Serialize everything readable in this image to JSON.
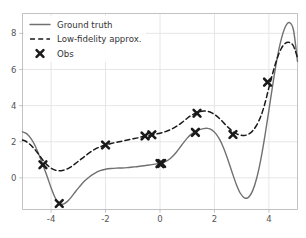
{
  "chart_data": {
    "type": "line",
    "title": "",
    "xlabel": "",
    "ylabel": "",
    "xlim": [
      -5.05,
      5.05
    ],
    "ylim": [
      -1.75,
      9.1
    ],
    "grid": true,
    "xticks": [
      -4,
      -2,
      0,
      2,
      4
    ],
    "xticklabels": [
      "-4",
      "-2",
      "0",
      "2",
      "4"
    ],
    "yticks": [
      0,
      2,
      4,
      6,
      8
    ],
    "yticklabels": [
      "0",
      "2",
      "4",
      "6",
      "8"
    ],
    "legend_position": "upper left",
    "series": [
      {
        "name": "Ground truth",
        "style": "solid",
        "color": "#707070",
        "x": [
          -5.05,
          -4.9,
          -4.75,
          -4.6,
          -4.45,
          -4.3,
          -4.15,
          -4.0,
          -3.85,
          -3.7,
          -3.55,
          -3.4,
          -3.25,
          -3.1,
          -2.95,
          -2.8,
          -2.6,
          -2.4,
          -2.2,
          -2.0,
          -1.8,
          -1.6,
          -1.4,
          -1.2,
          -1.0,
          -0.8,
          -0.6,
          -0.4,
          -0.2,
          0.0,
          0.2,
          0.4,
          0.6,
          0.8,
          1.0,
          1.15,
          1.3,
          1.45,
          1.6,
          1.75,
          1.9,
          2.05,
          2.2,
          2.35,
          2.5,
          2.65,
          2.8,
          2.95,
          3.1,
          3.25,
          3.4,
          3.55,
          3.7,
          3.85,
          4.0,
          4.15,
          4.3,
          4.45,
          4.6,
          4.75,
          4.9,
          5.05
        ],
        "y": [
          2.55,
          2.45,
          2.2,
          1.82,
          1.3,
          0.72,
          0.1,
          -0.55,
          -1.1,
          -1.42,
          -1.45,
          -1.3,
          -1.05,
          -0.75,
          -0.48,
          -0.22,
          0.05,
          0.25,
          0.4,
          0.48,
          0.52,
          0.54,
          0.55,
          0.57,
          0.6,
          0.63,
          0.67,
          0.71,
          0.76,
          0.8,
          0.9,
          1.1,
          1.42,
          1.82,
          2.2,
          2.42,
          2.56,
          2.67,
          2.73,
          2.74,
          2.66,
          2.45,
          2.1,
          1.6,
          0.98,
          0.3,
          -0.35,
          -0.85,
          -1.1,
          -1.08,
          -0.72,
          -0.02,
          1.0,
          2.3,
          3.75,
          5.25,
          6.6,
          7.65,
          8.35,
          8.6,
          8.2,
          6.45
        ]
      },
      {
        "name": "Low-fidelity approx.",
        "style": "dashed",
        "color": "#1a1a1a",
        "x": [
          -5.05,
          -4.9,
          -4.75,
          -4.6,
          -4.45,
          -4.3,
          -4.15,
          -4.0,
          -3.85,
          -3.7,
          -3.55,
          -3.4,
          -3.25,
          -3.1,
          -2.95,
          -2.8,
          -2.6,
          -2.4,
          -2.2,
          -2.0,
          -1.8,
          -1.6,
          -1.4,
          -1.2,
          -1.0,
          -0.8,
          -0.6,
          -0.4,
          -0.2,
          0.0,
          0.2,
          0.4,
          0.6,
          0.8,
          1.0,
          1.15,
          1.3,
          1.45,
          1.6,
          1.75,
          1.9,
          2.05,
          2.2,
          2.35,
          2.5,
          2.65,
          2.8,
          2.95,
          3.1,
          3.25,
          3.4,
          3.55,
          3.7,
          3.85,
          4.0,
          4.15,
          4.3,
          4.45,
          4.6,
          4.75,
          4.9,
          5.05
        ],
        "y": [
          2.1,
          2.0,
          1.82,
          1.58,
          1.28,
          0.98,
          0.72,
          0.54,
          0.43,
          0.39,
          0.42,
          0.5,
          0.63,
          0.8,
          0.98,
          1.15,
          1.38,
          1.58,
          1.72,
          1.82,
          1.9,
          1.97,
          2.03,
          2.1,
          2.16,
          2.22,
          2.3,
          2.36,
          2.42,
          2.47,
          2.56,
          2.68,
          2.85,
          3.06,
          3.3,
          3.46,
          3.58,
          3.66,
          3.7,
          3.68,
          3.6,
          3.46,
          3.26,
          3.03,
          2.8,
          2.6,
          2.45,
          2.37,
          2.35,
          2.42,
          2.6,
          2.92,
          3.4,
          4.1,
          5.0,
          5.85,
          6.6,
          7.15,
          7.45,
          7.5,
          7.3,
          6.65
        ]
      }
    ],
    "observations": {
      "name": "Obs",
      "marker": "x-bold",
      "color": "#1a1a1a",
      "points": [
        {
          "x": -4.3,
          "y": 0.73
        },
        {
          "x": -3.7,
          "y": -1.42
        },
        {
          "x": -2.0,
          "y": 1.82
        },
        {
          "x": -0.55,
          "y": 2.32
        },
        {
          "x": -0.3,
          "y": 2.39
        },
        {
          "x": 0.0,
          "y": 0.79
        },
        {
          "x": 0.06,
          "y": 0.8
        },
        {
          "x": 1.3,
          "y": 2.52
        },
        {
          "x": 1.36,
          "y": 3.58
        },
        {
          "x": 2.68,
          "y": 2.4
        },
        {
          "x": 3.95,
          "y": 5.3
        }
      ]
    },
    "legend": [
      {
        "label": "Ground truth",
        "style": "solid",
        "color": "#707070"
      },
      {
        "label": "Low-fidelity approx.",
        "style": "dashed",
        "color": "#1a1a1a"
      },
      {
        "label": "Obs",
        "style": "marker",
        "color": "#1a1a1a"
      }
    ],
    "colors": {
      "ground_truth": "#707070",
      "low_fidelity": "#1a1a1a",
      "obs": "#1a1a1a",
      "grid": "#e3e3e3",
      "axis": "#bbbbbb",
      "background": "#ffffff",
      "tick_label": "#555555"
    }
  }
}
